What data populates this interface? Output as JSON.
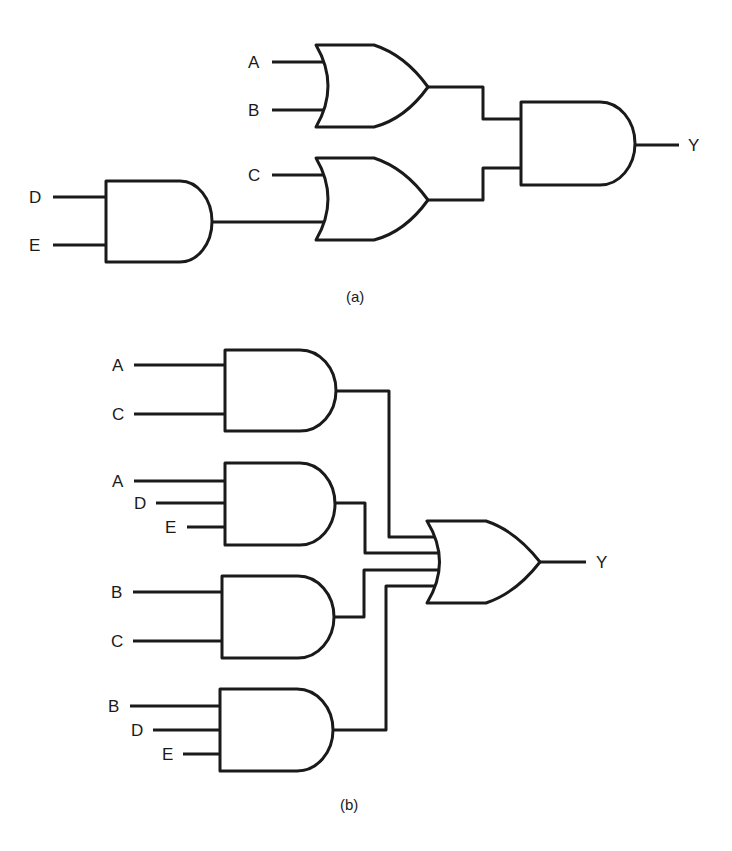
{
  "figure": {
    "panel_a": {
      "caption": "(a)",
      "inputs": {
        "a": "A",
        "b": "B",
        "c": "C",
        "d": "D",
        "e": "E"
      },
      "output": "Y",
      "gates": [
        {
          "id": "or1",
          "type": "OR",
          "inputs": [
            "A",
            "B"
          ]
        },
        {
          "id": "and_de",
          "type": "AND",
          "inputs": [
            "D",
            "E"
          ]
        },
        {
          "id": "or2",
          "type": "OR",
          "inputs": [
            "C",
            "and_de"
          ]
        },
        {
          "id": "and_out",
          "type": "AND",
          "inputs": [
            "or1",
            "or2"
          ],
          "output": "Y"
        }
      ]
    },
    "panel_b": {
      "caption": "(b)",
      "and1": {
        "in1": "A",
        "in2": "C"
      },
      "and2": {
        "in1": "A",
        "in2": "D",
        "in3": "E"
      },
      "and3": {
        "in1": "B",
        "in2": "C"
      },
      "and4": {
        "in1": "B",
        "in2": "D",
        "in3": "E"
      },
      "output": "Y",
      "gates": [
        {
          "id": "and1",
          "type": "AND",
          "inputs": [
            "A",
            "C"
          ]
        },
        {
          "id": "and2",
          "type": "AND",
          "inputs": [
            "A",
            "D",
            "E"
          ]
        },
        {
          "id": "and3",
          "type": "AND",
          "inputs": [
            "B",
            "C"
          ]
        },
        {
          "id": "and4",
          "type": "AND",
          "inputs": [
            "B",
            "D",
            "E"
          ]
        },
        {
          "id": "or_out",
          "type": "OR",
          "inputs": [
            "and1",
            "and2",
            "and3",
            "and4"
          ],
          "output": "Y"
        }
      ]
    }
  }
}
